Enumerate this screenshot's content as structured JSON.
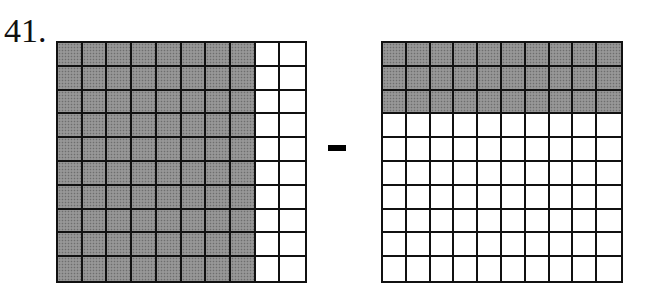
{
  "problem": {
    "number_label": "41.",
    "operator": "minus",
    "operator_symbol": "-"
  },
  "grids": [
    {
      "id": "left",
      "rows": 10,
      "cols": 10,
      "shading": "columns",
      "shaded_count": 8,
      "shaded_squares": 80,
      "value": 0.8
    },
    {
      "id": "right",
      "rows": 10,
      "cols": 10,
      "shading": "rows",
      "shaded_count": 3,
      "shaded_squares": 30,
      "value": 0.3
    }
  ],
  "colors": {
    "shaded": "#8e8e8e",
    "line": "#111111",
    "background": "#ffffff"
  }
}
